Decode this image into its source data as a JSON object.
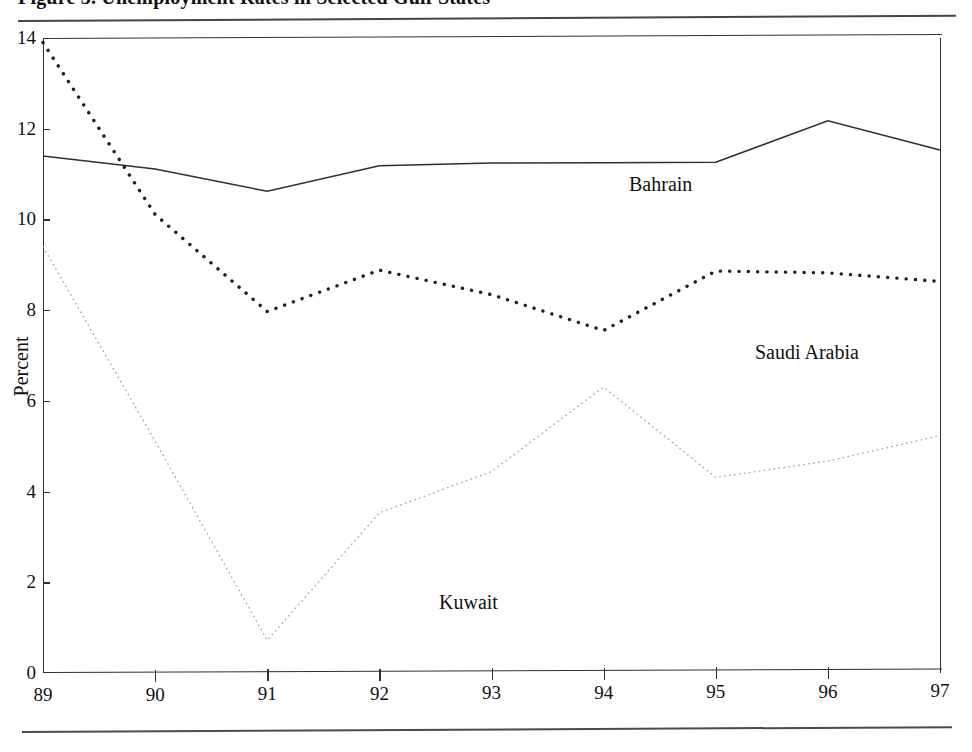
{
  "figure": {
    "caption_clipped": "Figure 3.  Unemployment Rates in Selected Gulf States",
    "top_rule": "horizontal-rule",
    "bottom_rule": "horizontal-rule"
  },
  "axes": {
    "ylabel": "Percent",
    "yticks": [
      "0",
      "2",
      "4",
      "6",
      "8",
      "10",
      "12",
      "14"
    ],
    "xticks": [
      "89",
      "90",
      "91",
      "92",
      "93",
      "94",
      "95",
      "96",
      "97"
    ]
  },
  "labels": {
    "bahrain": "Bahrain",
    "saudi": "Saudi Arabia",
    "kuwait": "Kuwait"
  },
  "chart_data": {
    "type": "line",
    "title": "",
    "xlabel": "",
    "ylabel": "Percent",
    "x": [
      "89",
      "90",
      "91",
      "92",
      "93",
      "94",
      "95",
      "96",
      "97"
    ],
    "xlim": [
      89,
      97
    ],
    "ylim": [
      0,
      14
    ],
    "grid": false,
    "legend": "inline-series-labels",
    "series": [
      {
        "name": "Bahrain",
        "style": "solid",
        "color": "#2f2f2f",
        "values": [
          11.4,
          11.1,
          10.6,
          11.15,
          11.2,
          11.2,
          11.2,
          12.1,
          11.45
        ]
      },
      {
        "name": "Saudi Arabia",
        "style": "dotted-bold",
        "color": "#1f1f1f",
        "values": [
          13.9,
          10.1,
          7.95,
          8.85,
          8.3,
          7.5,
          8.8,
          8.75,
          8.55
        ]
      },
      {
        "name": "Kuwait",
        "style": "dotted-fine",
        "color": "#9a9a9a",
        "values": [
          9.4,
          5.1,
          0.7,
          3.5,
          4.4,
          6.25,
          4.25,
          4.6,
          5.15
        ]
      }
    ]
  }
}
